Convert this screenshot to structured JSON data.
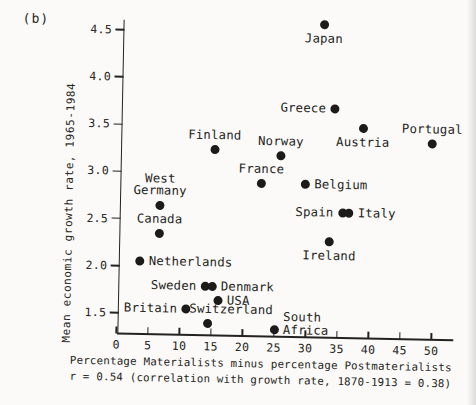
{
  "figure_label": "(b)",
  "colors": {
    "ink": "#23221f",
    "paper": "#fbfaf8",
    "dot": "#1c1b19"
  },
  "chart_data": {
    "type": "scatter",
    "title": "(b)",
    "xlabel": "Percentage Materialists minus percentage Postmaterialists",
    "xlabel_line2": "r = 0.54 (correlation with growth rate, 1870-1913 = 0.38)",
    "ylabel": "Mean economic growth rate, 1965-1984",
    "xlim": [
      0,
      53
    ],
    "ylim": [
      1.25,
      4.65
    ],
    "grid": false,
    "xticks": [
      0,
      5,
      10,
      15,
      20,
      25,
      30,
      35,
      40,
      45,
      50
    ],
    "yticks": [
      "4.5",
      "4.0",
      "3.5",
      "3.0",
      "2.5",
      "2.0",
      "1.5"
    ],
    "points": [
      {
        "label": "Japan",
        "x": 32,
        "y": 4.6,
        "label_position": "below"
      },
      {
        "label": "Greece",
        "x": 34,
        "y": 3.7,
        "label_position": "left"
      },
      {
        "label": "Austria",
        "x": 38.5,
        "y": 3.5,
        "label_position": "below"
      },
      {
        "label": "Portugal",
        "x": 49.5,
        "y": 3.35,
        "label_position": "above"
      },
      {
        "label": "Finland",
        "x": 15,
        "y": 3.25,
        "label_position": "above"
      },
      {
        "label": "Norway",
        "x": 25.5,
        "y": 3.2,
        "label_position": "above"
      },
      {
        "label": "France",
        "x": 22.5,
        "y": 2.9,
        "label_position": "above"
      },
      {
        "label": "Belgium",
        "x": 29.5,
        "y": 2.9,
        "label_position": "right"
      },
      {
        "label": "West\nGermany",
        "x": 6.5,
        "y": 2.65,
        "label_position": "above"
      },
      {
        "label": "Spain",
        "x": 35.5,
        "y": 2.6,
        "label_position": "left"
      },
      {
        "label": "Italy",
        "x": 36.5,
        "y": 2.6,
        "label_position": "right"
      },
      {
        "label": "Canada",
        "x": 6.5,
        "y": 2.35,
        "label_position": "above"
      },
      {
        "label": "Ireland",
        "x": 33.5,
        "y": 2.3,
        "label_position": "below"
      },
      {
        "label": "Netherlands",
        "x": 3.5,
        "y": 2.05,
        "label_position": "right"
      },
      {
        "label": "Sweden",
        "x": 14,
        "y": 1.8,
        "label_position": "left"
      },
      {
        "label": "Denmark",
        "x": 15,
        "y": 1.8,
        "label_position": "right"
      },
      {
        "label": "USA",
        "x": 16,
        "y": 1.65,
        "label_position": "right"
      },
      {
        "label": "Britain",
        "x": 11,
        "y": 1.55,
        "label_position": "left"
      },
      {
        "label": "Switzerland",
        "x": 14.5,
        "y": 1.4,
        "label_position": "above-right"
      },
      {
        "label": "South\nAfrica",
        "x": 25,
        "y": 1.35,
        "label_position": "right-stacked"
      }
    ]
  }
}
